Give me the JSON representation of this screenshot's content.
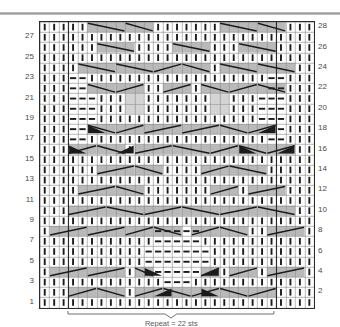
{
  "chart_data": {
    "type": "table",
    "rows": 28,
    "columns": 29,
    "row_numbers_left": [
      1,
      3,
      5,
      7,
      9,
      11,
      13,
      15,
      17,
      19,
      21,
      23,
      25,
      27
    ],
    "row_numbers_right": [
      2,
      4,
      6,
      8,
      10,
      12,
      14,
      16,
      18,
      20,
      22,
      24,
      26,
      28
    ],
    "symbol_legend": {
      "knit": "vertical bar",
      "purl": "horizontal dash",
      "cable_right": "diagonal line rising to the right on gray ground",
      "cable_left": "diagonal line falling to the right on gray ground",
      "solid_wedge": "filled black triangle"
    },
    "colors": {
      "grid_line": "#8a8a8a",
      "border": "#2b2b2b",
      "shade": "#b9b9b9",
      "shade_light": "#d4d4d4",
      "symbol": "#1b1b1b",
      "rule": "#9a9a9a",
      "label": "#4a4a4a"
    },
    "panel_dividers_after_columns": [
      3,
      25
    ],
    "repeat_bracket": {
      "start_column": 4,
      "end_column": 25,
      "label": "Repeat = 22 sts"
    },
    "cell_width_px": 9.45,
    "cell_height_px": 10.2
  },
  "chart_cells": {
    "note": "Per-row symbol strings, 29 characters each, bottom row (row 1) first. K=knit bar, P=purl dash, /=right diagonal, \\\\=left diagonal, V=chevron apex, B=black wedge, .=plain",
    "rows": [
      "KKKKKKKKKKKKKKKKKKKKKKKKKKKKK",
      "KKK//\\\\K KK//BB\\\\VV//BB\\\\//KKKK",
      "KKKKKKKKKKKKKKKKKKKKKKKKKKKKK",
      "K//..KKK/B\\\\BPPPPB\\\\/B..KKK//K",
      "KKKKKKKKKPPPPPPPKKKKKKKKKKKKK",
      "KKKKKKKKKPPPPPPPKKKKKKKKKKKKK",
      "KKKKKKKKKKPPPPPKKKKKKKKKKKKKK",
      "K//..KK//\\\\PPPPP\\\\//..KK//...K",
      "KKKKKKKKKKKKKKKKKKKKKKKKKKKKK",
      "KKK//..\\\\//..VV..\\\\//..\\\\KKKKKK",
      "KKKKKKKKKKKKKKKKKKKKKKKKKKKKK",
      "KKK..//..\\\\KKKKKK//..\\\\..KKKKK",
      "KKKKKKKKKKKKKKKKKKKKKKKKKKKKK",
      "KKKK..//..\\\\KKKK//..\\\\...KKKKK",
      "KKKKKKKKKKKKKKKKKKKKKKKKKKKKK",
      "KKKB//B\\\\..//..VV..\\\\..B//B\\\\K",
      "KKK--KKKKKKKKKKKKKKKKK--KKKKK",
      "KKK--B\\\\//KKKKKKKK//B\\\\B--KKKK",
      "KKK---KKKKKKKKKKKKKKK---KKKKK",
      "KKK---KKKKKKKKKKKKKKK---KKKKK",
      "KKK---KKKKKKKKKKKKKKK---KKKKK",
      "KKK--\\\\//KKKK//..\\\\K//--KKKKKK",
      "KKK--KKKKKKKKKKKKKKKKK--KKKKK",
      "KKKK\\\\..\\\\KKK//..VV..\\\\\\\\KKKKKK",
      "KKKKKKKKKKKKKKKKKKKKKKKKKKKKK",
      "KKKKK\\\\..KKKKKK\\\\..KKK\\\\..KKKKK",
      "KKKKKKKKKKKKKKKKKKKKKKKKKKKKK",
      "KKKKK\\\\..\\\\KKKKKKKK\\\\..\\\\..KKKK"
    ]
  }
}
